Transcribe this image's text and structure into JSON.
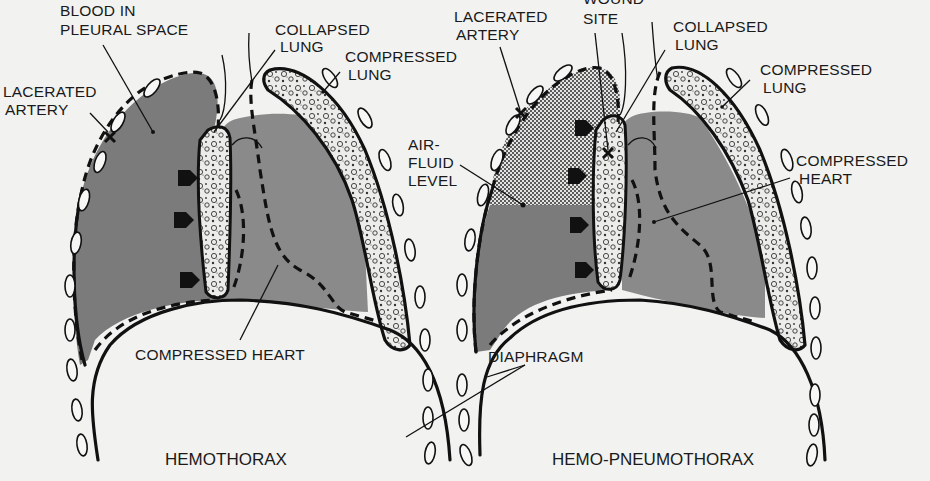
{
  "figure": {
    "background": "#f2f2f0",
    "blood_color": "#7b7b7b",
    "heart_color": "#8a8a8a",
    "line_color": "#111111"
  },
  "left_panel": {
    "title": "HEMOTHORAX",
    "labels": {
      "blood_line1": "BLOOD IN",
      "blood_line2": "PLEURAL SPACE",
      "collapsed_line1": "COLLAPSED",
      "collapsed_line2": "LUNG",
      "compressed_lung_line1": "COMPRESSED",
      "compressed_lung_line2": "LUNG",
      "artery_line1": "LACERATED",
      "artery_line2": "ARTERY",
      "heart": "COMPRESSED HEART"
    }
  },
  "right_panel": {
    "title": "HEMO-PNEUMOTHORAX",
    "labels": {
      "artery_line1": "LACERATED",
      "artery_line2": "ARTERY",
      "wound_line1": "WOUND",
      "wound_line2": "SITE",
      "collapsed_line1": "COLLAPSED",
      "collapsed_line2": "LUNG",
      "compressed_lung_line1": "COMPRESSED",
      "compressed_lung_line2": "LUNG",
      "airfluid_line1": "AIR-",
      "airfluid_line2": "FLUID",
      "airfluid_line3": "LEVEL",
      "heart_line1": "COMPRESSED",
      "heart_line2": "HEART",
      "diaphragm": "DIAPHRAGM"
    }
  }
}
